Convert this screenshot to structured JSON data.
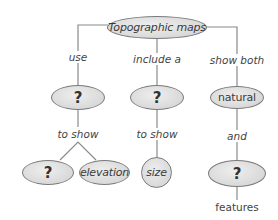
{
  "diagram": {
    "type": "concept-map",
    "colors": {
      "node_fill": "#dcdcdc",
      "node_border": "#7a7a7a",
      "line": "#8a8a8a",
      "text": "#3a3a3a"
    },
    "root": {
      "label": "Topographic maps"
    },
    "branches": [
      {
        "link_label": "use",
        "node": {
          "label": "?"
        },
        "sub_link_label": "to show",
        "children": [
          {
            "label": "?"
          },
          {
            "label": "elevation"
          }
        ]
      },
      {
        "link_label": "include a",
        "node": {
          "label": "?"
        },
        "sub_link_label": "to show",
        "children": [
          {
            "label": "size"
          }
        ]
      },
      {
        "link_label": "show both",
        "node": {
          "label": "natural"
        },
        "sub_link_label": "and",
        "children": [
          {
            "label": "?"
          }
        ],
        "trailing_label": "features"
      }
    ]
  }
}
